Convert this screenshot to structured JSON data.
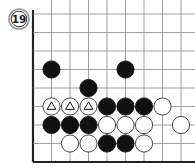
{
  "problem": {
    "number": "19"
  },
  "board": {
    "origin_x": 33,
    "origin_y": 14,
    "spacing": 18.5,
    "cols": 9,
    "rows": 9,
    "edges": [
      "left",
      "bottom"
    ],
    "line_color": "#888888",
    "edge_color": "#222222",
    "stone_radius": 8.6
  },
  "stones": [
    {
      "color": "black",
      "col": 1,
      "row": 3
    },
    {
      "color": "black",
      "col": 5,
      "row": 3
    },
    {
      "color": "black",
      "col": 3,
      "row": 4
    },
    {
      "color": "white",
      "col": 1,
      "row": 5,
      "mark": "triangle"
    },
    {
      "color": "white",
      "col": 2,
      "row": 5,
      "mark": "triangle"
    },
    {
      "color": "white",
      "col": 3,
      "row": 5,
      "mark": "triangle"
    },
    {
      "color": "black",
      "col": 4,
      "row": 5
    },
    {
      "color": "black",
      "col": 5,
      "row": 5
    },
    {
      "color": "black",
      "col": 6,
      "row": 5
    },
    {
      "color": "white",
      "col": 7,
      "row": 5
    },
    {
      "color": "black",
      "col": 1,
      "row": 6
    },
    {
      "color": "black",
      "col": 2,
      "row": 6
    },
    {
      "color": "black",
      "col": 3,
      "row": 6
    },
    {
      "color": "white",
      "col": 4,
      "row": 6
    },
    {
      "color": "white",
      "col": 5,
      "row": 6
    },
    {
      "color": "white",
      "col": 6,
      "row": 6
    },
    {
      "color": "white",
      "col": 8,
      "row": 6
    },
    {
      "color": "white",
      "col": 2,
      "row": 7
    },
    {
      "color": "white",
      "col": 3,
      "row": 7
    },
    {
      "color": "black",
      "col": 4,
      "row": 7
    },
    {
      "color": "black",
      "col": 5,
      "row": 7
    },
    {
      "color": "white",
      "col": 6,
      "row": 7
    }
  ]
}
